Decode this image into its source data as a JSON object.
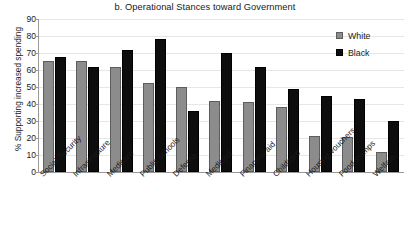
{
  "chart_data": {
    "type": "bar",
    "title": "b. Operational Stances toward Government",
    "xlabel": "",
    "ylabel": "% Supporting increased spending",
    "ylim": [
      0,
      90
    ],
    "ytick_step": 10,
    "yticks": [
      90,
      80,
      70,
      60,
      50,
      40,
      30,
      20,
      10,
      0
    ],
    "grid": true,
    "legend_position": "top-right",
    "categories": [
      "Social Security",
      "Infrastructure",
      "Medicare",
      "Public schools",
      "Defense",
      "Medicaid",
      "Financial aid",
      "Childcare",
      "Housing vouchers",
      "Food stamps",
      "Welfare"
    ],
    "series": [
      {
        "name": "White",
        "color": "#8c8c8c",
        "values": [
          65.5,
          65.5,
          61.5,
          52.5,
          50,
          41.5,
          41,
          38,
          21,
          20.5,
          11.5
        ]
      },
      {
        "name": "Black",
        "color": "#0d0d0d",
        "values": [
          67.5,
          62,
          71.5,
          78,
          36,
          70,
          62,
          49,
          44.5,
          43,
          30
        ]
      }
    ]
  },
  "legend": {
    "items": [
      {
        "label": "White",
        "swatch": "white"
      },
      {
        "label": "Black",
        "swatch": "black"
      }
    ]
  }
}
